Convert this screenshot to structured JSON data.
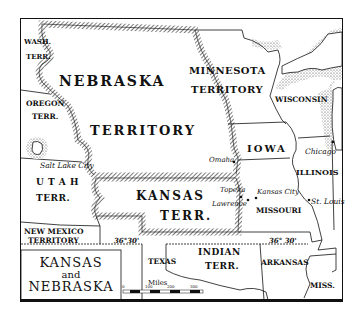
{
  "map": {
    "title": {
      "line1": "KANSAS",
      "line2": "and",
      "line3": "NEBRASKA"
    },
    "territories": {
      "nebraska": "NEBRASKA",
      "nebraska_sub": "TERRITORY",
      "minnesota": "MINNESOTA",
      "minnesota_sub": "TERRITORY",
      "wash": "WASH.",
      "wash_sub": "TERR.",
      "oregon": "OREGON",
      "oregon_sub": "TERR.",
      "utah": "U T A H",
      "utah_sub": "TERR.",
      "kansas": "KANSAS",
      "kansas_sub": "TERR.",
      "new_mexico": "NEW MEXICO",
      "new_mexico_sub": "TERRITORY",
      "indian": "INDIAN",
      "indian_sub": "TERR."
    },
    "states": {
      "wisconsin": "WISCONSIN",
      "iowa": "IOWA",
      "illinois": "ILLINOIS",
      "missouri": "MISSOURI",
      "texas": "TEXAS",
      "arkansas": "ARKANSAS",
      "mississippi": "MISS."
    },
    "cities": {
      "salt_lake": "Salt Lake City",
      "omaha": "Omaha",
      "chicago": "Chicago",
      "topeka": "Topeka",
      "lawrence": "Lawrence",
      "kansas_city": "Kansas City",
      "st_louis": "St. Louis"
    },
    "parallel_label_west": "36°30'",
    "parallel_label_east": "36° 30'",
    "scale": {
      "label": "Miles",
      "ticks": [
        "0",
        "100",
        "200",
        "300"
      ]
    },
    "colors": {
      "ink": "#111111",
      "paper": "#ffffff",
      "hatch": "#555555"
    }
  }
}
